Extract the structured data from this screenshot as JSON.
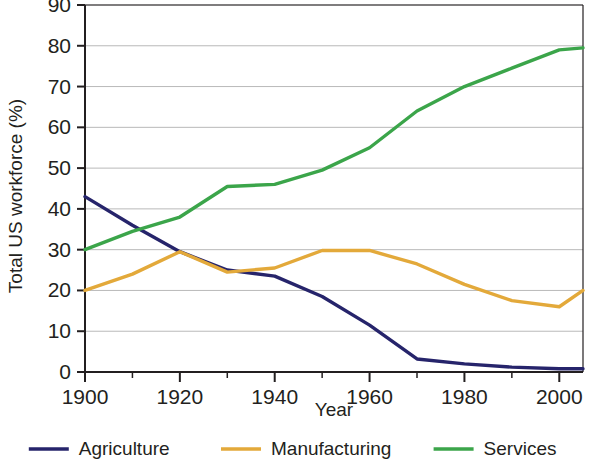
{
  "chart_data": {
    "type": "line",
    "title": "",
    "xlabel": "Year",
    "ylabel": "Total US workforce (%)",
    "xlim": [
      1900,
      2005
    ],
    "ylim": [
      0,
      90
    ],
    "grid": "horizontal",
    "legend_position": "bottom",
    "x": [
      1900,
      1910,
      1920,
      1930,
      1940,
      1950,
      1960,
      1970,
      1980,
      1990,
      2000,
      2005
    ],
    "xticks": [
      1900,
      1920,
      1940,
      1960,
      1980,
      2000
    ],
    "xtick_labels": [
      "1900",
      "1920",
      "1940",
      "1960",
      "1980",
      "2000"
    ],
    "xminor_ticks": [
      1910,
      1930,
      1950,
      1970,
      1990
    ],
    "yticks": [
      0,
      10,
      20,
      30,
      40,
      50,
      60,
      70,
      80,
      90
    ],
    "ytick_labels": [
      "0",
      "10",
      "20",
      "30",
      "40",
      "50",
      "60",
      "70",
      "80",
      "90"
    ],
    "series": [
      {
        "name": "Agriculture",
        "color": "#26246b",
        "x": [
          1900,
          1910,
          1920,
          1930,
          1940,
          1950,
          1960,
          1970,
          1980,
          1990,
          2000,
          2005
        ],
        "values": [
          43.0,
          36.0,
          29.5,
          25.0,
          23.5,
          18.5,
          11.5,
          3.2,
          2.0,
          1.2,
          0.8,
          0.8
        ]
      },
      {
        "name": "Manufacturing",
        "color": "#e3a93a",
        "x": [
          1900,
          1910,
          1920,
          1930,
          1940,
          1950,
          1960,
          1970,
          1980,
          1990,
          2000,
          2005
        ],
        "values": [
          20.0,
          24.0,
          29.5,
          24.5,
          25.5,
          29.8,
          29.8,
          26.5,
          21.5,
          17.5,
          16.0,
          20.0
        ]
      },
      {
        "name": "Services",
        "color": "#3ba54a",
        "x": [
          1900,
          1910,
          1920,
          1930,
          1940,
          1950,
          1960,
          1970,
          1980,
          1990,
          2000,
          2005
        ],
        "values": [
          30.0,
          34.5,
          38.0,
          45.5,
          46.0,
          49.5,
          55.0,
          64.0,
          70.0,
          74.5,
          79.0,
          79.5
        ]
      }
    ]
  },
  "axes": {
    "y_title": "Total US workforce (%)",
    "x_title": "Year"
  },
  "legend": {
    "items": [
      {
        "label": "Agriculture",
        "color": "#26246b"
      },
      {
        "label": "Manufacturing",
        "color": "#e3a93a"
      },
      {
        "label": "Services",
        "color": "#3ba54a"
      }
    ]
  },
  "style": {
    "axis_color": "#231f20",
    "grid_color": "#b9b9b9",
    "background": "#ffffff"
  }
}
